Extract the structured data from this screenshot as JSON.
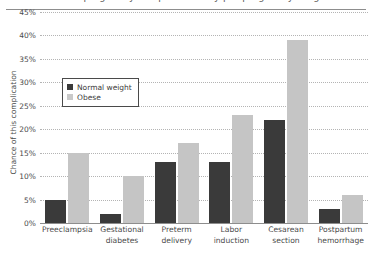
{
  "title_strip": {
    "clipped_title": "Risks of pregnancy complications by pre-pregnancy weight"
  },
  "legend": {
    "entries": [
      {
        "label": "Normal weight",
        "color": "#3a3a3a",
        "key": "normal"
      },
      {
        "label": "Obese",
        "color": "#c9c9c9",
        "key": "obese"
      }
    ]
  },
  "axes": {
    "y_title": "Chance of this complication",
    "y_ticks": [
      "0%",
      "5%",
      "10%",
      "15%",
      "20%",
      "25%",
      "30%",
      "35%",
      "40%",
      "45%"
    ]
  },
  "chart_data": {
    "type": "bar",
    "title": "Risks of pregnancy complications by pre-pregnancy weight",
    "xlabel": "",
    "ylabel": "Chance of this complication",
    "ylim": [
      0,
      45
    ],
    "ytick_step": 5,
    "grid": true,
    "legend_position": "inside-top-left",
    "categories": [
      "Preeclampsia",
      "Gestational diabetes",
      "Preterm delivery",
      "Labor induction",
      "Cesarean section",
      "Postpartum hemorrhage"
    ],
    "category_lines": [
      [
        "Preeclampsia"
      ],
      [
        "Gestational",
        "diabetes"
      ],
      [
        "Preterm",
        "delivery"
      ],
      [
        "Labor",
        "induction"
      ],
      [
        "Cesarean",
        "section"
      ],
      [
        "Postpartum",
        "hemorrhage"
      ]
    ],
    "series": [
      {
        "name": "Normal weight",
        "color": "#3a3a3a",
        "values": [
          5,
          2,
          13,
          13,
          22,
          3
        ]
      },
      {
        "name": "Obese",
        "color": "#c5c5c5",
        "values": [
          15,
          10,
          17,
          23,
          39,
          6
        ]
      }
    ],
    "value_unit": "%"
  }
}
